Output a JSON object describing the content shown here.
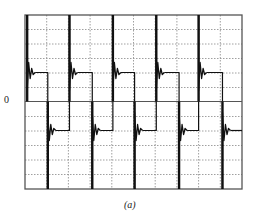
{
  "figure": {
    "caption": "(a)",
    "zero_label": "0"
  },
  "colors": {
    "frame": "#555555",
    "grid": "#888888",
    "trace": "#111111",
    "background": "#ffffff"
  },
  "chart_data": {
    "type": "line",
    "title": "",
    "xlabel": "",
    "ylabel": "",
    "caption": "(a)",
    "y_tick_labels": [
      "0"
    ],
    "grid": true,
    "grid_divisions": {
      "x": 10,
      "y": 12
    },
    "xlim": [
      0,
      10
    ],
    "ylim": [
      -6,
      6
    ],
    "series": [
      {
        "name": "square wave with ringing",
        "period_divisions": 2,
        "high_level": 2,
        "low_level": -2,
        "spike_peak_high": 6,
        "spike_peak_low": -6,
        "rising_edges_div": [
          0.1,
          2.05,
          4.05,
          6.05,
          8.0
        ],
        "falling_edges_div": [
          1.05,
          3.1,
          5.05,
          7.1,
          9.1
        ]
      }
    ]
  }
}
